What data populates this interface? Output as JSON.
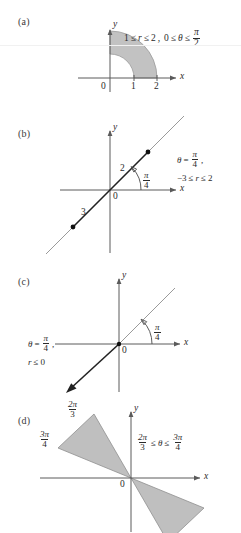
{
  "figure": {
    "type": "math-polar-coordinate-regions",
    "background": "#ffffff",
    "shade_color": "#c2c2c2",
    "axis_color": "#5a5a5a",
    "panels": [
      {
        "id": "a",
        "label": "(a)",
        "axis_x_label": "x",
        "axis_y_label": "y",
        "origin_label": "0",
        "ticks": [
          "1",
          "2"
        ],
        "annotation": {
          "r_min": "1",
          "r_max": "2",
          "theta_min": "0",
          "theta_max_num": "π",
          "theta_max_den": "2",
          "lead": "1",
          "r_symbol": "r",
          "theta_symbol": "θ",
          "le": "≤",
          "comma": ","
        },
        "description": "Quarter annulus between r=1 and r=2 in the first quadrant"
      },
      {
        "id": "b",
        "label": "(b)",
        "axis_x_label": "x",
        "axis_y_label": "y",
        "origin_label": "0",
        "angle_num": "π",
        "angle_den": "4",
        "seg_upper_label": "2",
        "seg_lower_label": "3",
        "annotation": {
          "theta_symbol": "θ",
          "equals": "=",
          "angle_num": "π",
          "angle_den": "4",
          "comma": ",",
          "r_min": "−3",
          "r_max": "2",
          "r_symbol": "r",
          "le": "≤"
        },
        "description": "Line segment along theta = pi/4 from r = -3 to r = 2"
      },
      {
        "id": "c",
        "label": "(c)",
        "axis_x_label": "x",
        "axis_y_label": "y",
        "origin_label": "0",
        "angle_num": "π",
        "angle_den": "4",
        "annotation": {
          "theta_symbol": "θ",
          "equals": "=",
          "angle_num": "π",
          "angle_den": "4",
          "comma": ",",
          "r_symbol": "r",
          "le": "≤",
          "r_max": "0"
        },
        "description": "Ray along theta = pi/4 with r <= 0 going into third quadrant"
      },
      {
        "id": "d",
        "label": "(d)",
        "axis_x_label": "x",
        "axis_y_label": "y",
        "origin_label": "0",
        "ray_labels": [
          {
            "num": "2π",
            "den": "3"
          },
          {
            "num": "3π",
            "den": "4"
          }
        ],
        "annotation": {
          "min_num": "2π",
          "min_den": "3",
          "max_num": "3π",
          "max_den": "4",
          "theta_symbol": "θ",
          "le": "≤"
        },
        "description": "Bowtie wedge between theta = 2pi/3 and theta = 3pi/4 including negative r"
      }
    ]
  }
}
